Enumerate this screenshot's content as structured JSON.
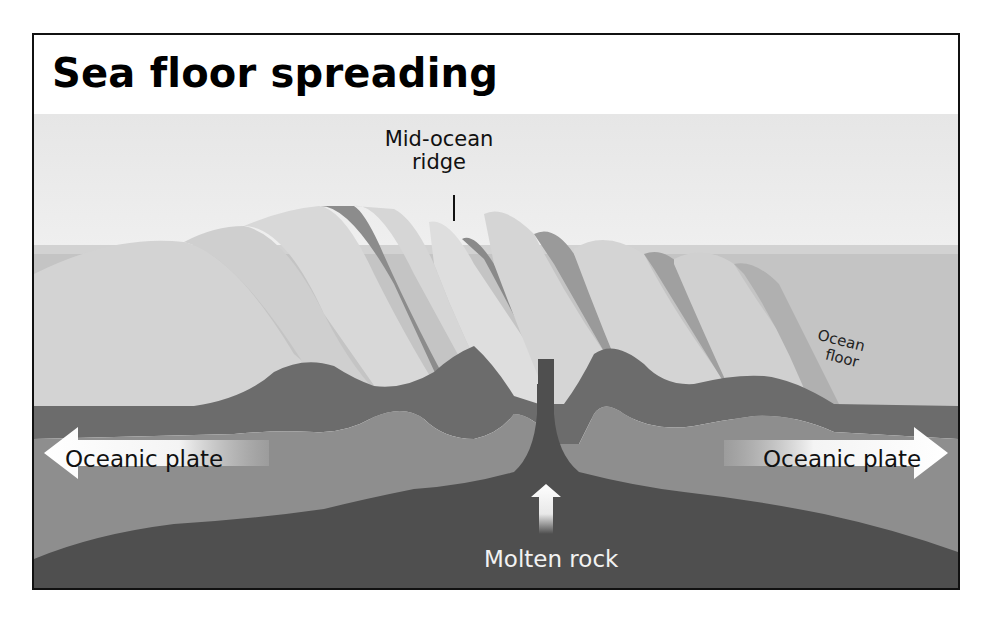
{
  "title": "Sea floor spreading",
  "labels": {
    "mid_ocean_ridge_line1": "Mid-ocean",
    "mid_ocean_ridge_line2": "ridge",
    "ocean_floor_line1": "Ocean",
    "ocean_floor_line2": "floor",
    "oceanic_plate_left": "Oceanic plate",
    "oceanic_plate_right": "Oceanic plate",
    "molten_rock": "Molten rock"
  },
  "arrows": [
    {
      "name": "left-plate-arrow",
      "direction": "left"
    },
    {
      "name": "right-plate-arrow",
      "direction": "right"
    },
    {
      "name": "molten-rock-arrow",
      "direction": "up"
    }
  ],
  "colors": {
    "sky": "#ececec",
    "water": "#c9c9c9",
    "ridge_light": "#dcdcdc",
    "ridge_shadow": "#8a8a8a",
    "crust_dark": "#6a6a6a",
    "lithosphere": "#8c8c8c",
    "mantle": "#4e4e4e",
    "frame": "#111111"
  }
}
